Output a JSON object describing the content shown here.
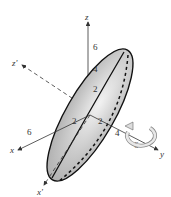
{
  "diagram": {
    "axes": {
      "z": "z",
      "z_prime": "z'",
      "x": "x",
      "x_prime": "x'",
      "y": "y"
    },
    "tick_labels": {
      "z_6": "6",
      "z_4": "4",
      "z_2": "2",
      "x_6": "6",
      "y_4": "4",
      "y_6": "6",
      "inner_2a": "2",
      "inner_2b": "2"
    },
    "rotation_arrow": "rotation-about-y-axis",
    "colors": {
      "surface": "#d6d6d6",
      "outline": "#111111",
      "axis": "#333333"
    }
  }
}
